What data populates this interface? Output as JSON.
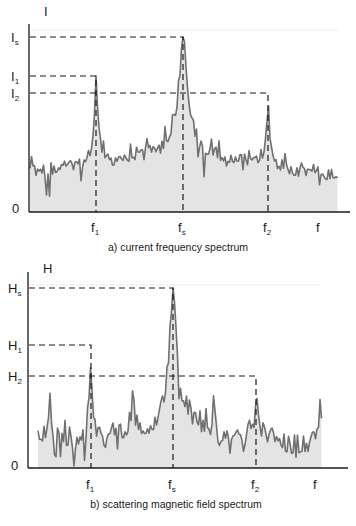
{
  "figure": {
    "panels": [
      {
        "id": "a",
        "caption": "a) current frequency spectrum",
        "y_axis_label": "I",
        "x_axis_label": "f",
        "origin_label": "0",
        "y_levels": [
          {
            "name": "Is",
            "base": "I",
            "sub": "s",
            "relative": 1.0
          },
          {
            "name": "I1",
            "base": "I",
            "sub": "1",
            "relative": 0.78
          },
          {
            "name": "I2",
            "base": "I",
            "sub": "2",
            "relative": 0.68
          }
        ],
        "x_marks": [
          {
            "name": "f1",
            "base": "f",
            "sub": "1",
            "peak": "I1"
          },
          {
            "name": "fs",
            "base": "f",
            "sub": "s",
            "peak": "Is"
          },
          {
            "name": "f2",
            "base": "f",
            "sub": "2",
            "peak": "I2"
          }
        ]
      },
      {
        "id": "b",
        "caption": "b) scattering magnetic field spectrum",
        "y_axis_label": "H",
        "x_axis_label": "f",
        "origin_label": "0",
        "y_levels": [
          {
            "name": "Hs",
            "base": "H",
            "sub": "s",
            "relative": 1.0
          },
          {
            "name": "H1",
            "base": "H",
            "sub": "1",
            "relative": 0.68
          },
          {
            "name": "H2",
            "base": "H",
            "sub": "2",
            "relative": 0.51
          }
        ],
        "x_marks": [
          {
            "name": "f1",
            "base": "f",
            "sub": "1",
            "peak": "H1"
          },
          {
            "name": "fs",
            "base": "f",
            "sub": "s",
            "peak": "Hs"
          },
          {
            "name": "f2",
            "base": "f",
            "sub": "2",
            "peak": "H2"
          }
        ]
      }
    ],
    "colors": {
      "axis": "#1a1a1a",
      "dash": "#1a1a1a",
      "signal_line": "#6e6e6e",
      "signal_fill": "#e4e4e4",
      "grid_faint": "#efefef"
    }
  }
}
